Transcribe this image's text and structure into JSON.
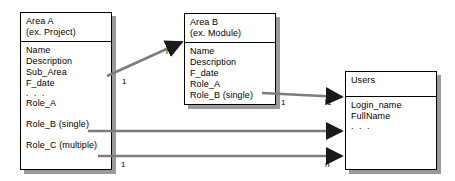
{
  "diagram": {
    "line_color": "#7d7d7d",
    "arrowhead_color": "#1a1a1a",
    "box_border_color": "#000000",
    "shadow_color": "#9a9a9a",
    "background": "#ffffff"
  },
  "entities": {
    "area_a": {
      "name": "Area A",
      "subtitle": "(ex. Project)",
      "attributes": [
        "Name",
        "Description",
        "Sub_Area",
        "F_date",
        ". . .",
        "Role_A",
        "Role_B (single)",
        "Role_C (multiple)"
      ]
    },
    "area_b": {
      "name": "Area B",
      "subtitle": "(ex. Module)",
      "attributes": [
        "Name",
        "Description",
        "F_date",
        "Role_A",
        "Role_B (single)"
      ]
    },
    "users": {
      "name": "Users",
      "subtitle": "",
      "attributes": [
        "Login_name",
        "FullName",
        ". . ."
      ]
    }
  },
  "relationships": [
    {
      "id": "area-a-to-area-b",
      "from": "area_a",
      "to": "area_b",
      "source_cardinality": "1",
      "target_cardinality": "n"
    },
    {
      "id": "area-b-role-b-to-users",
      "from": "area_b",
      "to": "users",
      "source_cardinality": "1",
      "target_cardinality": "1"
    },
    {
      "id": "area-a-role-b-to-users",
      "from": "area_a",
      "to": "users",
      "source_cardinality": "",
      "target_cardinality": ""
    },
    {
      "id": "area-a-role-c-to-users",
      "from": "area_a",
      "to": "users",
      "source_cardinality": "1",
      "target_cardinality": "n"
    }
  ]
}
